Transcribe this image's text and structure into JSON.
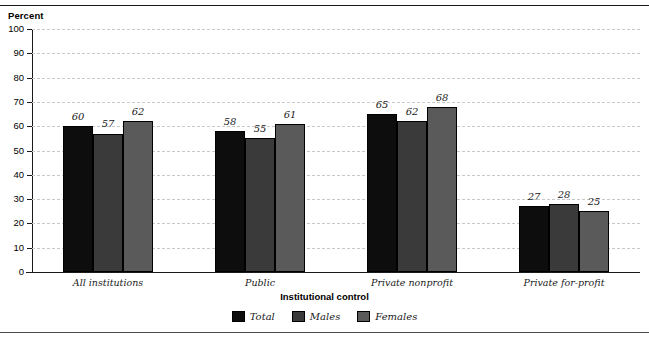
{
  "chart_data": {
    "type": "bar",
    "title": "",
    "xlabel": "Institutional control",
    "ylabel": "Percent",
    "ylim": [
      0,
      100
    ],
    "yticks": [
      0,
      10,
      20,
      30,
      40,
      50,
      60,
      70,
      80,
      90,
      100
    ],
    "grid": true,
    "legend_position": "bottom",
    "categories": [
      "All institutions",
      "Public",
      "Private nonprofit",
      "Private for-profit"
    ],
    "series": [
      {
        "name": "Total",
        "color": "#0d0d0d",
        "values": [
          60,
          58,
          65,
          27
        ]
      },
      {
        "name": "Males",
        "color": "#3a3a3a",
        "values": [
          57,
          55,
          62,
          28
        ]
      },
      {
        "name": "Females",
        "color": "#5a5a5a",
        "values": [
          62,
          61,
          68,
          25
        ]
      }
    ]
  },
  "axis_unit_label": "Percent"
}
